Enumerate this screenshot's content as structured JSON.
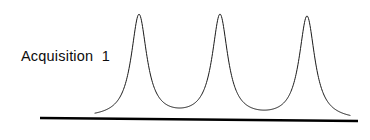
{
  "canvas": {
    "width": 370,
    "height": 140,
    "background": "#ffffff"
  },
  "annotation": {
    "label": "Acquisition  1"
  },
  "chart_data": {
    "type": "line",
    "title": "",
    "subtitle": "",
    "xlabel": "",
    "ylabel": "",
    "annotations": [
      "Acquisition  1"
    ],
    "legend": [],
    "grid": false,
    "axes_visible": {
      "x": true,
      "y": false
    },
    "xlim": [
      40,
      358
    ],
    "ylim": [
      0,
      1
    ],
    "baseline": {
      "x_start": 40,
      "y_start": 118,
      "x_end": 358,
      "y_end": 121,
      "color": "#000000",
      "width": 2.6
    },
    "curve": {
      "color": "#1a1a1a",
      "width": 1.0,
      "shape": "lorentzian",
      "x_start": 95,
      "x_end": 350,
      "peak_apex_y": 15,
      "peak_height": 103,
      "half_width": 9.5
    },
    "series": [
      {
        "name": "signal",
        "peaks": [
          {
            "center": 139,
            "height": 103,
            "half_width": 9.5
          },
          {
            "center": 220,
            "height": 103,
            "half_width": 9.5
          },
          {
            "center": 307,
            "height": 103,
            "half_width": 9.5
          }
        ]
      }
    ],
    "valleys": [
      180,
      264
    ],
    "x": [
      139,
      220,
      307
    ],
    "values": [
      1.0,
      1.0,
      1.0
    ],
    "categories": [
      "peak 1",
      "peak 2",
      "peak 3"
    ]
  },
  "colors": {
    "ink": "#000000",
    "curve": "#1a1a1a",
    "background": "#ffffff"
  }
}
